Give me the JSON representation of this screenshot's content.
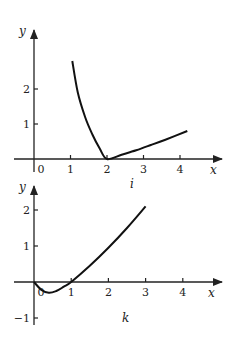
{
  "chart_data": [
    {
      "type": "line",
      "label": "i",
      "xlabel": "x",
      "ylabel": "y",
      "x_ticks": [
        "0",
        "1",
        "2",
        "3",
        "4"
      ],
      "y_ticks": [
        "1",
        "2"
      ],
      "xlim": [
        0,
        4.5
      ],
      "ylim": [
        0,
        3
      ],
      "grid": false,
      "series": [
        {
          "name": "i",
          "x": [
            1.05,
            1.2,
            1.4,
            1.6,
            1.8,
            2.0,
            2.4,
            2.8,
            3.2,
            3.6,
            4.2
          ],
          "y": [
            2.8,
            1.9,
            1.2,
            0.7,
            0.3,
            0.0,
            0.12,
            0.25,
            0.4,
            0.55,
            0.8
          ]
        }
      ]
    },
    {
      "type": "line",
      "label": "k",
      "xlabel": "x",
      "ylabel": "y",
      "x_ticks": [
        "0",
        "1",
        "2",
        "3",
        "4"
      ],
      "y_ticks": [
        "-1",
        "1",
        "2"
      ],
      "xlim": [
        0,
        4.5
      ],
      "ylim": [
        -1,
        2.5
      ],
      "grid": false,
      "series": [
        {
          "name": "k",
          "x": [
            0,
            0.2,
            0.4,
            0.6,
            0.8,
            1.0,
            1.5,
            2.0,
            2.5,
            3.0
          ],
          "y": [
            0,
            -0.22,
            -0.3,
            -0.25,
            -0.13,
            0.0,
            0.45,
            0.95,
            1.5,
            2.1
          ]
        }
      ]
    }
  ]
}
